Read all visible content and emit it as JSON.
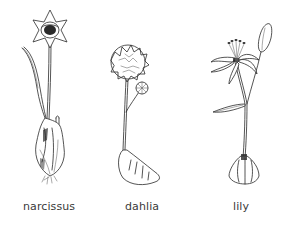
{
  "figure": {
    "plants": [
      {
        "name": "narcissus",
        "label": "narcissus"
      },
      {
        "name": "dahlia",
        "label": "dahlia"
      },
      {
        "name": "lily",
        "label": "lily"
      }
    ]
  },
  "colors": {
    "background": "#ffffff",
    "ink": "#2a2a2a",
    "label_text": "#3a3a3a"
  }
}
